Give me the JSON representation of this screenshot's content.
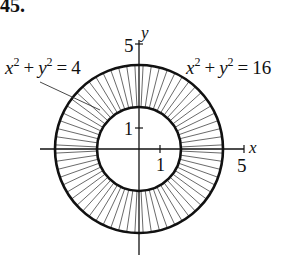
{
  "problem_number": "45.",
  "figure": {
    "equations": {
      "inner": {
        "lhs_x": "x",
        "lhs_y": "y",
        "exp": "2",
        "plus": "+",
        "eq": "=",
        "rhs": "4"
      },
      "outer": {
        "lhs_x": "x",
        "lhs_y": "y",
        "exp": "2",
        "plus": "+",
        "eq": "=",
        "rhs": "16"
      }
    },
    "axes": {
      "x_label": "x",
      "y_label": "y",
      "x_tick_1": "1",
      "y_tick_1": "1",
      "x_tick_5": "5",
      "y_tick_5": "5"
    },
    "inner_radius": 2,
    "outer_radius": 4,
    "hatch_count": 64,
    "colors": {
      "ink": "#111111",
      "hatch": "#444444",
      "background": "#ffffff"
    }
  }
}
